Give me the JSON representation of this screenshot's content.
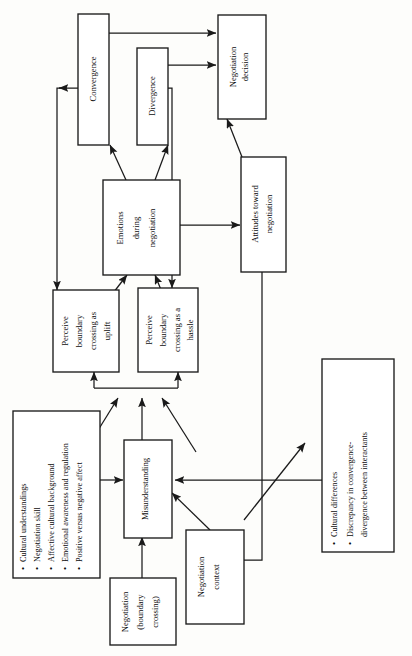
{
  "figure": {
    "orientation": "rotated-90-ccw",
    "type": "flow-diagram",
    "background_color": "#fdfdfb",
    "line_color": "#1a1a1a",
    "box_fill": "#ffffff"
  },
  "nodes": {
    "convergence": {
      "id": "convergence",
      "label": "Convergence"
    },
    "divergence": {
      "id": "divergence",
      "label": "Divergence"
    },
    "negotiation_decision": {
      "id": "negotiation-decision",
      "line1": "Negotiation",
      "line2": "decision"
    },
    "emotions": {
      "id": "emotions-during-negotiation",
      "line1": "Emotions",
      "line2": "during",
      "line3": "negotiation"
    },
    "attitudes": {
      "id": "attitudes-toward-negotiation",
      "line1": "Attitudes toward",
      "line2": "negotiation"
    },
    "perceive_uplift": {
      "id": "perceive-boundary-crossing-uplift",
      "line1": "Perceive",
      "line2": "boundary",
      "line3": "crossing as",
      "line4": "uplift"
    },
    "perceive_hassle": {
      "id": "perceive-boundary-crossing-hassle",
      "line1": "Perceive",
      "line2": "boundary",
      "line3": "crossing as a",
      "line4": "hassle"
    },
    "misunderstanding": {
      "id": "misunderstanding",
      "label": "Misunderstanding"
    },
    "negotiation_boundary": {
      "id": "negotiation-boundary-crossing",
      "line1": "Negotiation",
      "line2": "(boundary",
      "line3": "crossing)"
    },
    "negotiation_context": {
      "id": "negotiation-context",
      "line1": "Negotiation",
      "line2": "context"
    },
    "individual_factors": {
      "id": "individual-factors-list",
      "bullets": [
        "Cultural understandings",
        "Negotiation skill",
        "Affective cultural background",
        "Emotional awareness and regulation",
        "Positive versus negative affect"
      ]
    },
    "cultural_differences": {
      "id": "cultural-differences-list",
      "bullets": [
        "Cultural differences",
        "Discrepancy in convergence-",
        "divergence between interactants"
      ]
    }
  },
  "edges": [
    {
      "from": "emotions",
      "to": "convergence"
    },
    {
      "from": "emotions",
      "to": "divergence"
    },
    {
      "from": "convergence",
      "to": "negotiation-decision"
    },
    {
      "from": "divergence",
      "to": "negotiation-decision"
    },
    {
      "from": "attitudes",
      "to": "negotiation-decision"
    },
    {
      "from": "emotions",
      "to": "attitudes"
    },
    {
      "from": "convergence",
      "to": "perceive-boundary-crossing-uplift"
    },
    {
      "from": "divergence",
      "to": "perceive-boundary-crossing-hassle"
    },
    {
      "from": "perceive-boundary-crossing-uplift",
      "to": "emotions"
    },
    {
      "from": "perceive-boundary-crossing-hassle",
      "to": "emotions"
    },
    {
      "from": "individual-factors-list",
      "to": "perceive-boundary-crossing-uplift"
    },
    {
      "from": "misunderstanding",
      "to": "perceive-boundary-crossing-uplift"
    },
    {
      "from": "misunderstanding",
      "to": "perceive-boundary-crossing-hassle"
    },
    {
      "from": "individual-factors-list",
      "to": "misunderstanding"
    },
    {
      "from": "negotiation-boundary-crossing",
      "to": "misunderstanding"
    },
    {
      "from": "negotiation-context",
      "to": "misunderstanding"
    },
    {
      "from": "cultural-differences-list",
      "to": "misunderstanding"
    },
    {
      "from": "negotiation-context",
      "to": "cultural-differences-list"
    },
    {
      "from": "attitudes",
      "to": "negotiation-context"
    }
  ]
}
